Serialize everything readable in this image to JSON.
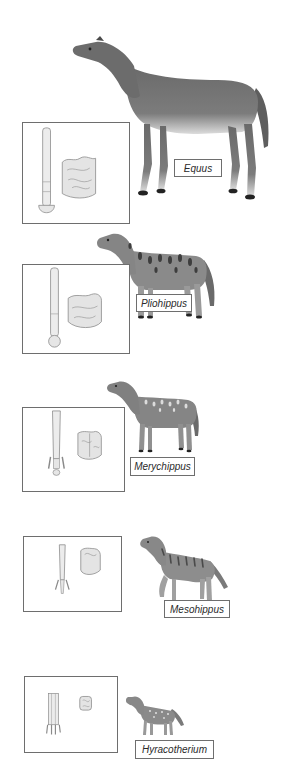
{
  "diagram": {
    "topic": "horse evolution",
    "order": "most recent at top, oldest at bottom",
    "stages": [
      {
        "genus": "Equus",
        "coat": "solid",
        "coat_color": "#6f6f6f",
        "inset": [
          "foot-bone",
          "molar-tooth"
        ],
        "toe_count_depicted": 1
      },
      {
        "genus": "Pliohippus",
        "coat": "dark spots",
        "coat_color": "#8a8a8a",
        "inset": [
          "foot-bone",
          "molar-tooth"
        ],
        "toe_count_depicted": 1
      },
      {
        "genus": "Merychippus",
        "coat": "light spots",
        "coat_color": "#858585",
        "inset": [
          "foot-bone",
          "molar-tooth"
        ],
        "toe_count_depicted": 3
      },
      {
        "genus": "Mesohippus",
        "coat": "dark stripes",
        "coat_color": "#8d8d8d",
        "inset": [
          "foot-bone",
          "molar-tooth"
        ],
        "toe_count_depicted": 3
      },
      {
        "genus": "Hyracotherium",
        "coat": "light spots",
        "coat_color": "#8a8a8a",
        "inset": [
          "foot-bone",
          "molar-tooth"
        ],
        "toe_count_depicted": 4
      }
    ]
  },
  "colors": {
    "background": "#ffffff",
    "frame": "#6e6e6e",
    "label_text": "#2a2a2a",
    "bone": "#e9e9e9",
    "bone_outline": "#8a8a8a"
  }
}
